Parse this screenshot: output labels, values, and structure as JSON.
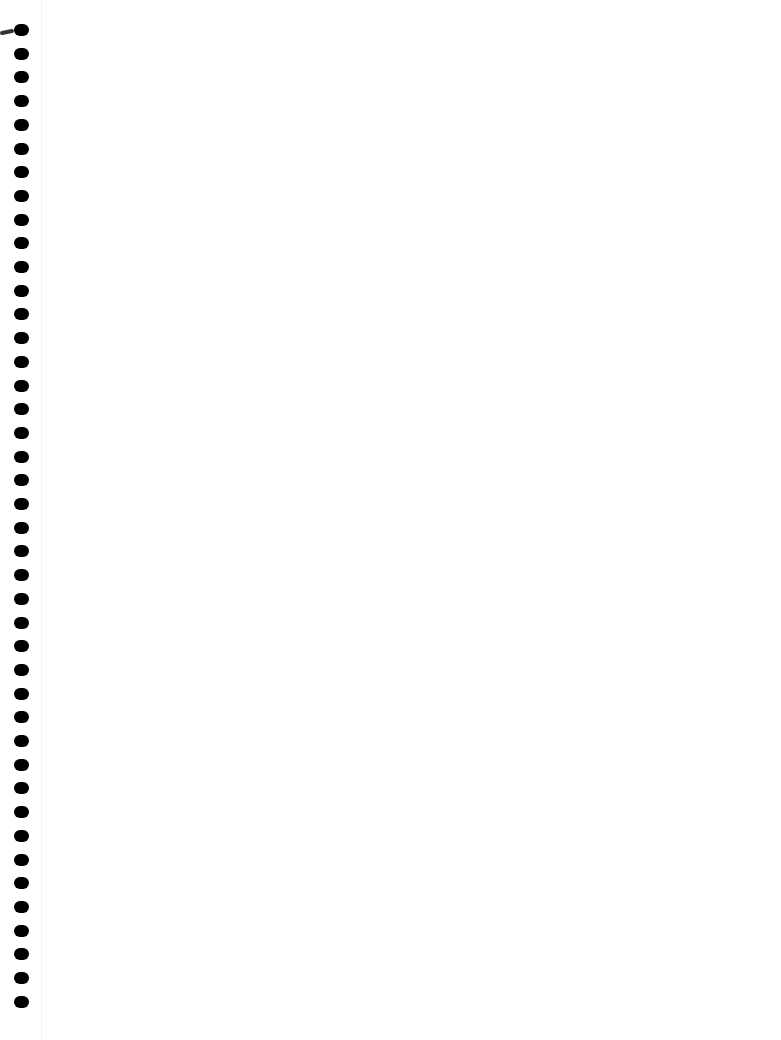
{
  "page": {
    "type": "blank notebook page",
    "background": "#ffffff",
    "text": ""
  },
  "binding": {
    "hole_count": 42,
    "hole_color": "#000000",
    "first_hole_y": 30,
    "spacing": 23.7,
    "x": 14
  }
}
